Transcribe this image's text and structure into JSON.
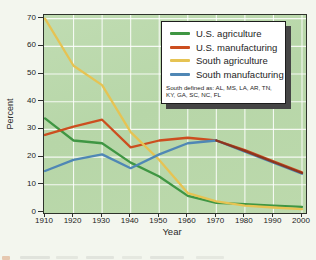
{
  "figure": {
    "background": "#f3f6ee",
    "plot_background": "#bad8ab",
    "grid_color": "rgba(255,255,255,0.85)",
    "border_color": "#2e332b",
    "ylabel": "Percent",
    "xlabel": "Year"
  },
  "legend": {
    "background": "#ffffff",
    "border_color": "#1c1c1c",
    "shadow_color": "#454545",
    "note_line1": "South defined as:  AL, MS, LA, AR, TN,",
    "note_line2": "KY, GA, SC, NC, FL"
  },
  "chart_data": {
    "type": "line",
    "x": [
      1910,
      1920,
      1930,
      1940,
      1950,
      1960,
      1970,
      1980,
      1990,
      2000
    ],
    "series": [
      {
        "name": "U.S. agriculture",
        "color": "#3f9643",
        "values": [
          34,
          26,
          25,
          18,
          13,
          6,
          3.5,
          3,
          2.5,
          2
        ]
      },
      {
        "name": "U.S. manufacturing",
        "color": "#cc4e1f",
        "values": [
          28,
          31,
          33.5,
          23.5,
          26,
          27,
          26,
          22.5,
          18.5,
          14.5
        ]
      },
      {
        "name": "South agriculture",
        "color": "#e6c353",
        "values": [
          70,
          53,
          46,
          29,
          19,
          7,
          4,
          2.5,
          1.8,
          1.2
        ]
      },
      {
        "name": "South manufacturing",
        "color": "#4f87b5",
        "values": [
          15,
          19,
          21,
          16,
          21,
          25,
          26,
          22,
          18,
          14
        ]
      }
    ],
    "title": "",
    "xlabel": "Year",
    "ylabel": "Percent",
    "ylim": [
      0,
      71.5
    ],
    "yticks": [
      0,
      10,
      20,
      30,
      40,
      50,
      60,
      70
    ],
    "grid": true,
    "legend_position": "top-right",
    "legend_note": "South defined as:  AL, MS, LA, AR, TN, KY, GA, SC, NC, FL",
    "overlap_segment": {
      "between": [
        "U.S. manufacturing",
        "South manufacturing"
      ],
      "from_x": 1970,
      "color": "#8e351d"
    }
  }
}
